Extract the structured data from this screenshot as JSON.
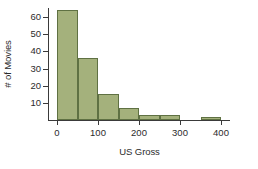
{
  "chart_data": {
    "type": "bar",
    "title": "",
    "subtitle": "",
    "xlabel": "US Gross",
    "ylabel": "# of Movies",
    "grid": false,
    "legend": "none",
    "histogram": true,
    "bin_width": 50,
    "x": [
      0,
      50,
      100,
      150,
      200,
      250,
      300,
      350
    ],
    "bin_edges": [
      0,
      50,
      100,
      150,
      200,
      250,
      300,
      350,
      400
    ],
    "categories": [
      "0-50",
      "50-100",
      "100-150",
      "150-200",
      "200-250",
      "250-300",
      "300-350",
      "350-400"
    ],
    "values": [
      64,
      36,
      15,
      7,
      3,
      3,
      0,
      2
    ],
    "xlim": [
      0,
      400
    ],
    "ylim": [
      0,
      68
    ],
    "xticks": [
      0,
      100,
      200,
      300,
      400
    ],
    "xtick_labels": [
      "0",
      "100",
      "200",
      "300",
      "400"
    ],
    "yticks": [
      10,
      20,
      30,
      40,
      50,
      60
    ],
    "ytick_labels": [
      "10",
      "20",
      "30",
      "40",
      "50",
      "60"
    ],
    "bar_fill_color": "#a4b17c",
    "bar_edge_color": "#5f7143",
    "axis_color": "#3a3a3a",
    "background_color": "#ffffff"
  }
}
